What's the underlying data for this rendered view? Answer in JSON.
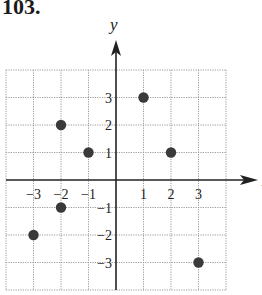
{
  "problem_number": "103.",
  "chart_data": {
    "type": "scatter",
    "title": "",
    "xlabel": "x",
    "ylabel": "y",
    "xlim": [
      -4,
      4
    ],
    "ylim": [
      -4,
      4
    ],
    "grid": true,
    "x_ticks": [
      -3,
      -2,
      -1,
      1,
      2,
      3
    ],
    "y_ticks": [
      3,
      2,
      1,
      -1,
      -2,
      -3
    ],
    "x_tick_labels": [
      "−3",
      "−2",
      "−1",
      "1",
      "2",
      "3"
    ],
    "y_tick_labels": [
      "3",
      "2",
      "1",
      "−1",
      "−2",
      "−3"
    ],
    "points": [
      {
        "x": 1,
        "y": 3
      },
      {
        "x": -2,
        "y": 2
      },
      {
        "x": -1,
        "y": 1
      },
      {
        "x": 2,
        "y": 1
      },
      {
        "x": -2,
        "y": -1
      },
      {
        "x": -3,
        "y": -2
      },
      {
        "x": 3,
        "y": -3
      }
    ],
    "colors": {
      "point": "#3a3a3a",
      "axis": "#222222",
      "grid": "#9a9a9a"
    }
  }
}
